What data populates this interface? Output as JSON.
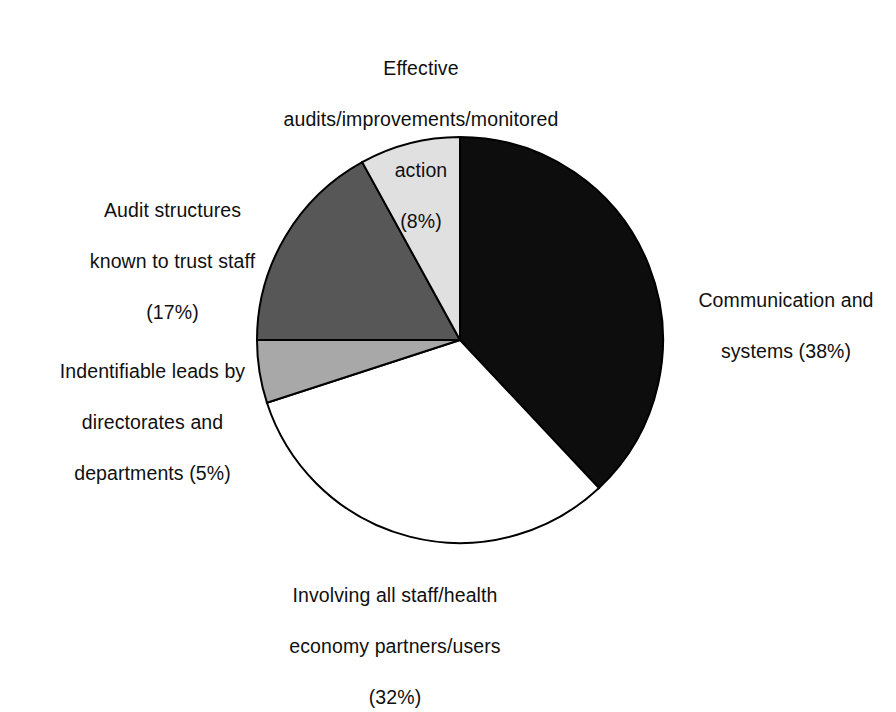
{
  "chart_data": {
    "type": "pie",
    "title": "",
    "subtitle": "",
    "xlabel": "",
    "ylabel": "",
    "legend_position": "none",
    "grid": false,
    "labels_outside": true,
    "start_angle_deg": 0,
    "direction": "clockwise",
    "center": {
      "x": 460,
      "y": 340
    },
    "radius": 203,
    "categories": [
      "Communication and systems",
      "Involving all staff/health economy partners/users",
      "Indentifiable leads by directorates and departments",
      "Audit structures known to trust staff",
      "Effective audits/improvements/monitored action"
    ],
    "values": [
      38,
      32,
      5,
      17,
      8
    ],
    "value_unit": "%",
    "slices": [
      {
        "name": "Communication and systems",
        "value": 38,
        "value_label": "(38%)",
        "color": "#0d0d0d",
        "start_deg": 0,
        "end_deg": 136.8,
        "label_lines": [
          "Communication and",
          "systems (38%)"
        ]
      },
      {
        "name": "Involving all staff/health economy partners/users",
        "value": 32,
        "value_label": "(32%)",
        "color": "#ffffff",
        "start_deg": 136.8,
        "end_deg": 252.0,
        "label_lines": [
          "Involving all staff/health",
          "economy partners/users",
          "(32%)"
        ]
      },
      {
        "name": "Indentifiable leads by directorates and departments",
        "value": 5,
        "value_label": "(5%)",
        "color": "#a8a8a8",
        "start_deg": 252.0,
        "end_deg": 270.0,
        "label_lines": [
          "Indentifiable leads by",
          "directorates and",
          "departments (5%)"
        ]
      },
      {
        "name": "Audit structures known to trust staff",
        "value": 17,
        "value_label": "(17%)",
        "color": "#575757",
        "start_deg": 270.0,
        "end_deg": 331.2,
        "label_lines": [
          "Audit structures",
          "known to trust staff",
          "(17%)"
        ]
      },
      {
        "name": "Effective audits/improvements/monitored action",
        "value": 8,
        "value_label": "(8%)",
        "color": "#e0e0e0",
        "start_deg": 331.2,
        "end_deg": 360.0,
        "label_lines": [
          "Effective",
          "audits/improvements/monitored",
          "action",
          "(8%)"
        ]
      }
    ]
  },
  "labels": {
    "effective_audits": {
      "line1": "Effective",
      "line2": "audits/improvements/monitored",
      "line3": "action",
      "line4": "(8%)"
    },
    "audit_structures": {
      "line1": "Audit structures",
      "line2": "known to trust staff",
      "line3": "(17%)"
    },
    "indentifiable_leads": {
      "line1": "Indentifiable leads by",
      "line2": "directorates and",
      "line3": "departments (5%)"
    },
    "communication": {
      "line1": "Communication and",
      "line2": "systems (38%)"
    },
    "involving_staff": {
      "line1": "Involving all staff/health",
      "line2": "economy partners/users",
      "line3": "(32%)"
    }
  },
  "colors": {
    "slice_black": "#0d0d0d",
    "slice_white": "#ffffff",
    "slice_mid_grey": "#a8a8a8",
    "slice_dark_grey": "#575757",
    "slice_light_grey": "#e0e0e0",
    "outline": "#000000",
    "background": "#ffffff",
    "text": "#101010"
  }
}
